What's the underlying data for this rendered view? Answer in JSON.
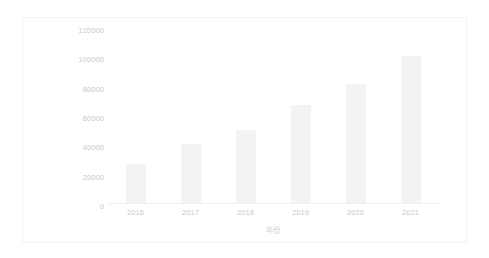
{
  "chart_data": {
    "type": "bar",
    "title": "",
    "subtitle": "",
    "xlabel": "年份",
    "ylabel": "销售、行政及一般费用/万美元",
    "categories": [
      "2016",
      "2017",
      "2018",
      "2019",
      "2020",
      "2021"
    ],
    "values": [
      26500,
      40000,
      50000,
      67000,
      81000,
      100000
    ],
    "series": [
      {
        "name": "销售、行政及一般费用/万美元",
        "values": [
          26500,
          40000,
          50000,
          67000,
          81000,
          100000
        ]
      }
    ],
    "ylim": [
      0,
      120000
    ],
    "ytick_labels": [
      "120000",
      "100000",
      "80000",
      "60000",
      "40000",
      "20000",
      "0"
    ],
    "ytick_values": [
      120000,
      100000,
      80000,
      60000,
      40000,
      20000,
      0
    ],
    "xtick_labels": [
      "2016",
      "2017",
      "2018",
      "2019",
      "2020",
      "2021"
    ],
    "grid": false,
    "legend": null,
    "legend_position": "none",
    "bar_color": "#f3f3f3",
    "axis_text_color": "#c9c9c9",
    "frame_color": "#f4f4f4",
    "background_color": "#ffffff"
  }
}
